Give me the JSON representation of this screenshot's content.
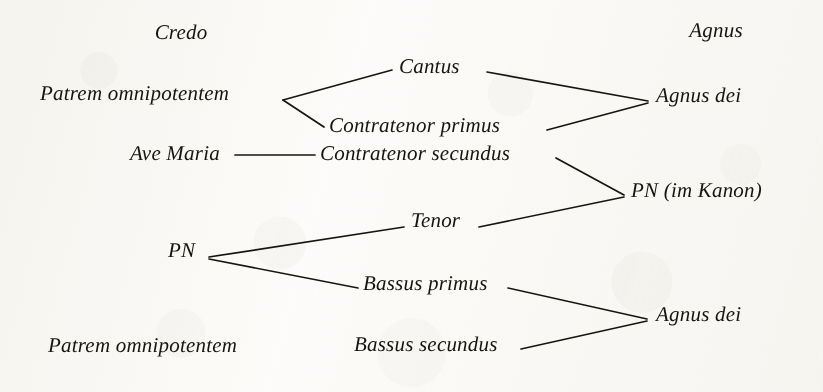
{
  "diagram": {
    "title_left": "Credo",
    "title_right": "Agnus",
    "ink_color": "#17150f",
    "paper_color": "#fdfdfc",
    "columns": {
      "left_source_label": "Credo / Ave Maria / PN sources",
      "middle_voices_label": "Voices",
      "right_target_label": "Agnus"
    },
    "nodes": [
      {
        "id": "credo",
        "text": "Credo",
        "x": 181,
        "y": 38,
        "align": "center"
      },
      {
        "id": "agnus",
        "text": "Agnus",
        "x": 716,
        "y": 36,
        "align": "center"
      },
      {
        "id": "patrem_top",
        "text": "Patrem omnipotentem",
        "x": 40,
        "y": 99,
        "align": "left"
      },
      {
        "id": "cantus",
        "text": "Cantus",
        "x": 399,
        "y": 72,
        "align": "left"
      },
      {
        "id": "contratenor_primus",
        "text": "Contratenor primus",
        "x": 329,
        "y": 131,
        "align": "left"
      },
      {
        "id": "agnus_dei_top",
        "text": "Agnus dei",
        "x": 656,
        "y": 101,
        "align": "left"
      },
      {
        "id": "ave_maria",
        "text": "Ave Maria",
        "x": 130,
        "y": 159,
        "align": "left"
      },
      {
        "id": "contratenor_secundus",
        "text": "Contratenor secundus",
        "x": 320,
        "y": 159,
        "align": "left"
      },
      {
        "id": "pn_im_kanon",
        "text": "PN (im Kanon)",
        "x": 631,
        "y": 196,
        "align": "left"
      },
      {
        "id": "tenor",
        "text": "Tenor",
        "x": 411,
        "y": 226,
        "align": "left"
      },
      {
        "id": "pn",
        "text": "PN",
        "x": 168,
        "y": 256,
        "align": "left"
      },
      {
        "id": "bassus_primus",
        "text": "Bassus primus",
        "x": 363,
        "y": 289,
        "align": "left"
      },
      {
        "id": "agnus_dei_bottom",
        "text": "Agnus dei",
        "x": 656,
        "y": 320,
        "align": "left"
      },
      {
        "id": "patrem_bottom",
        "text": "Patrem omnipotentem",
        "x": 48,
        "y": 351,
        "align": "left"
      },
      {
        "id": "bassus_secundus",
        "text": "Bassus secundus",
        "x": 354,
        "y": 350,
        "align": "left"
      }
    ],
    "connectors": [
      {
        "id": "patrem-to-cantus",
        "from": "patrem_top",
        "to": "cantus",
        "points": "283,100 392,70"
      },
      {
        "id": "patrem-to-contratenor-primus",
        "from": "patrem_top",
        "to": "contratenor_primus",
        "points": "283,100 324,127"
      },
      {
        "id": "cantus-to-agnus-dei",
        "from": "cantus",
        "to": "agnus_dei_top",
        "points": "487,72 648,101"
      },
      {
        "id": "contratenor-primus-to-agnus-dei",
        "from": "contratenor_primus",
        "to": "agnus_dei_top",
        "points": "547,130 648,103"
      },
      {
        "id": "ave-maria-to-contratenor-secundus",
        "from": "ave_maria",
        "to": "contratenor_secundus",
        "points": "235,155 315,155"
      },
      {
        "id": "contratenor-secundus-to-pn-kanon",
        "from": "contratenor_secundus",
        "to": "pn_im_kanon",
        "points": "556,158 624,195"
      },
      {
        "id": "tenor-to-pn-kanon",
        "from": "tenor",
        "to": "pn_im_kanon",
        "points": "479,227 624,197"
      },
      {
        "id": "pn-to-tenor",
        "from": "pn",
        "to": "tenor",
        "points": "209,257 404,227"
      },
      {
        "id": "pn-to-bassus-primus",
        "from": "pn",
        "to": "bassus_primus",
        "points": "209,259 358,288"
      },
      {
        "id": "bassus-primus-to-agnus-dei",
        "from": "bassus_primus",
        "to": "agnus_dei_bottom",
        "points": "508,288 647,319"
      },
      {
        "id": "bassus-secundus-to-agnus-dei",
        "from": "bassus_secundus",
        "to": "agnus_dei_bottom",
        "points": "521,349 647,321"
      }
    ]
  }
}
